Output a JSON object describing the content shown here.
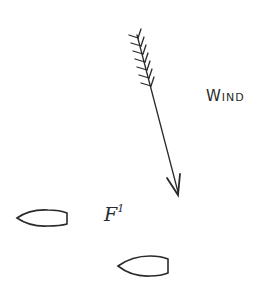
{
  "diagram": {
    "wind": {
      "label": "Wind",
      "icon": "arrow-icon",
      "direction": "down-right",
      "start": [
        137,
        35
      ],
      "end": [
        178,
        195
      ]
    },
    "fleet": {
      "label_main": "F",
      "label_sup": "1",
      "boats": [
        {
          "name": "boat-1",
          "x": 17,
          "y": 210,
          "w": 48,
          "h": 17
        },
        {
          "name": "boat-2",
          "x": 118,
          "y": 256,
          "w": 50,
          "h": 20
        }
      ]
    },
    "colors": {
      "ink": "#2a2a2a",
      "background": "#ffffff"
    }
  }
}
